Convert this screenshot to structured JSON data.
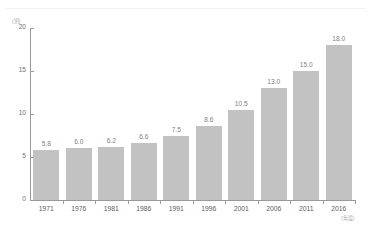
{
  "chart_data": {
    "type": "bar",
    "title": "",
    "subtitle": "",
    "xlabel": "(年度)",
    "ylabel": "(別)",
    "categories": [
      "1971",
      "1976",
      "1981",
      "1986",
      "1991",
      "1996",
      "2001",
      "2006",
      "2011",
      "2016"
    ],
    "values": [
      5.8,
      6.0,
      6.2,
      6.6,
      7.5,
      8.6,
      10.5,
      13.0,
      15.0,
      18.0
    ],
    "value_labels": [
      "5.8",
      "6.0",
      "6.2",
      "6.6",
      "7.5",
      "8.6",
      "10.5",
      "13.0",
      "15.0",
      "18.0"
    ],
    "ylim": [
      0,
      20
    ],
    "y_ticks": [
      0,
      5,
      10,
      15,
      20
    ],
    "y_tick_labels": [
      "0",
      "5",
      "10",
      "15",
      "20"
    ],
    "grid": false,
    "legend": null,
    "bar_color": "#c2c2c2",
    "axis_color": "#9a9a9a",
    "value_label_color": "#808080",
    "tick_label_color": "#5d5d5d"
  }
}
